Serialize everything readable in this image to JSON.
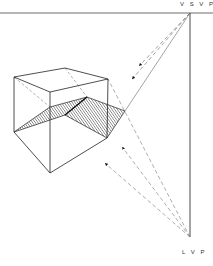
{
  "diagram": {
    "title": "",
    "labels": {
      "vsvp": "V S V P",
      "lvp": "L V P"
    },
    "colors": {
      "line": "#2a2a2a",
      "dashed": "#6a6a6a",
      "hatch": "#333333",
      "background": "#ffffff"
    },
    "points": {
      "vsvp": [
        190,
        13
      ],
      "lvp": [
        190,
        237
      ]
    }
  }
}
